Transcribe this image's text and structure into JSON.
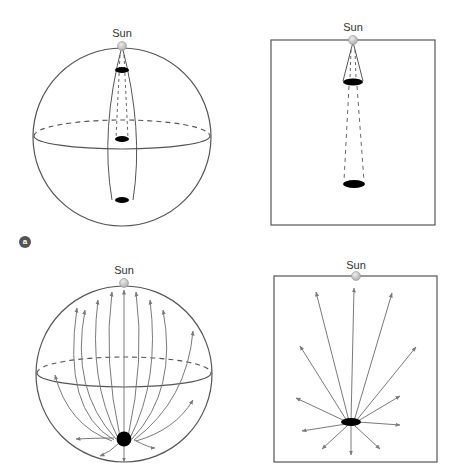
{
  "panel_a_label": "a",
  "colors": {
    "outline": "#555555",
    "arrow": "#7a7a7a",
    "sun_fill": "#c8c8c8",
    "shadow": "#000000"
  },
  "panels": [
    {
      "id": "top-left",
      "type": "sphere",
      "sun_label": "Sun",
      "description": "Sphere with narrow cone from Sun casting three shadow discs"
    },
    {
      "id": "top-right",
      "type": "box",
      "sun_label": "Sun",
      "description": "Flat projection with cone from Sun and two shadow discs"
    },
    {
      "id": "bottom-left",
      "type": "sphere",
      "sun_label": "Sun",
      "description": "Sphere with field lines radiating from black spot toward Sun"
    },
    {
      "id": "bottom-right",
      "type": "box",
      "sun_label": "Sun",
      "description": "Flat projection with arrows radiating from black ellipse"
    }
  ]
}
